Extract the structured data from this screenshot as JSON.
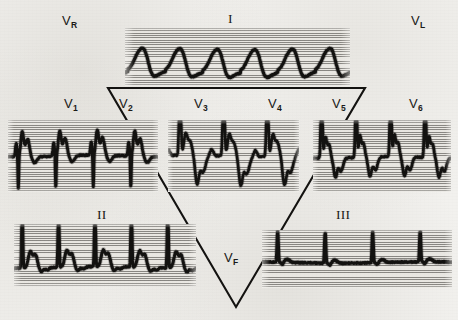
{
  "figure": {
    "type": "ecg-12-lead-einthoven-triangle",
    "background_color": "#f2f1ee",
    "strip_paper_color": "#e9e7e2",
    "trace_color": "#131210",
    "triangle_color": "#141311",
    "width": 458,
    "height": 320
  },
  "labels": {
    "vr": {
      "base": "V",
      "sub": "R"
    },
    "vl": {
      "base": "V",
      "sub": "L"
    },
    "vf": {
      "base": "V",
      "sub": "F"
    },
    "lead_i": "I",
    "lead_ii": "II",
    "lead_iii": "III",
    "v1": {
      "base": "V",
      "sub": "1"
    },
    "v2": {
      "base": "V",
      "sub": "2"
    },
    "v3": {
      "base": "V",
      "sub": "3"
    },
    "v4": {
      "base": "V",
      "sub": "4"
    },
    "v5": {
      "base": "V",
      "sub": "5"
    },
    "v6": {
      "base": "V",
      "sub": "6"
    }
  },
  "triangle": {
    "vertices": [
      [
        108,
        88
      ],
      [
        365,
        88
      ],
      [
        236,
        307
      ]
    ],
    "stroke_width": 2.1
  },
  "chart_data": {
    "type": "line",
    "xlabel": "",
    "ylabel": "",
    "grid": "horizontal ruled lines, ~2.35 px spacing",
    "legend": "none",
    "traces": [
      {
        "name": "I",
        "label": "I",
        "rect": [
          125,
          28,
          225,
          58
        ],
        "beats": 6,
        "baseline_frac": 0.74,
        "morphology": "low-amplitude broad rounded R with slurred descent; heavy dark baseline",
        "r_amp_frac": 0.3,
        "q_amp_frac": 0.0,
        "s_amp_frac": 0.09,
        "t_amp_frac": 0.0,
        "spike_width_frac": 0.3,
        "thick": 3.1,
        "style": "rounded",
        "first_offset_frac": 0.08
      },
      {
        "name": "V1-V2",
        "label": "V1/V2",
        "rect": [
          8,
          120,
          150,
          72
        ],
        "beats": 4,
        "baseline_frac": 0.5,
        "morphology": "rS pattern: small r then deep narrow S descending far below baseline, broad upright T",
        "r_amp_frac": 0.34,
        "q_amp_frac": 0.0,
        "s_amp_frac": 0.46,
        "t_amp_frac": 0.0,
        "spike_width_frac": 0.22,
        "thick": 2.9,
        "style": "deepS",
        "first_offset_frac": 0.05
      },
      {
        "name": "V3-V4",
        "label": "V3/V4",
        "rect": [
          168,
          120,
          131,
          72
        ],
        "beats": 3,
        "baseline_frac": 0.5,
        "morphology": "very tall narrow R reaching top of strip, steep descent, deep rounded S and low T",
        "r_amp_frac": 0.48,
        "q_amp_frac": 0.0,
        "s_amp_frac": 0.38,
        "t_amp_frac": 0.0,
        "spike_width_frac": 0.1,
        "thick": 2.7,
        "style": "tallspike",
        "first_offset_frac": 0.1
      },
      {
        "name": "V5-V6",
        "label": "V5/V6",
        "rect": [
          313,
          120,
          138,
          72
        ],
        "beats": 4,
        "baseline_frac": 0.52,
        "morphology": "tall narrow R with concave rounded descent to sagging ST and low flat baseline",
        "r_amp_frac": 0.46,
        "q_amp_frac": 0.0,
        "s_amp_frac": 0.26,
        "t_amp_frac": 0.0,
        "spike_width_frac": 0.12,
        "thick": 2.8,
        "style": "roundedR",
        "first_offset_frac": 0.09
      },
      {
        "name": "II",
        "label": "II",
        "rect": [
          14,
          224,
          182,
          62
        ],
        "beats": 5,
        "baseline_frac": 0.7,
        "morphology": "sharp tall narrow R spike followed by broad rounded T wave on heavy baseline",
        "r_amp_frac": 0.52,
        "q_amp_frac": 0.0,
        "s_amp_frac": 0.06,
        "t_amp_frac": 0.26,
        "spike_width_frac": 0.08,
        "thick": 3.0,
        "style": "spikeT",
        "first_offset_frac": 0.07
      },
      {
        "name": "III",
        "label": "III",
        "rect": [
          262,
          230,
          190,
          58
        ],
        "beats": 4,
        "baseline_frac": 0.56,
        "morphology": "nearly flat heavy baseline with small narrow upright R spikes, minimal T",
        "r_amp_frac": 0.34,
        "q_amp_frac": 0.0,
        "s_amp_frac": 0.04,
        "t_amp_frac": 0.05,
        "spike_width_frac": 0.045,
        "thick": 3.2,
        "style": "flatspike",
        "first_offset_frac": 0.13
      }
    ]
  }
}
